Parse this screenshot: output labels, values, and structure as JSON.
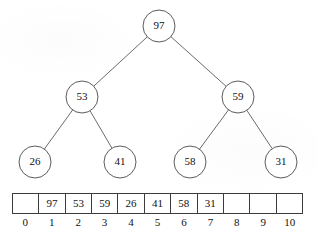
{
  "figure": {
    "stroke_color": "#4a4a4a",
    "edge_color": "#5a5a5a",
    "node_fill": "#ffffff",
    "text_color": "#111111"
  },
  "tree": {
    "node_radius": 16,
    "nodes": [
      {
        "id": "root",
        "label": "97",
        "cx": 159,
        "cy": 26,
        "level": 0
      },
      {
        "id": "n53",
        "label": "53",
        "cx": 82,
        "cy": 97,
        "level": 1
      },
      {
        "id": "n59",
        "label": "59",
        "cx": 238,
        "cy": 97,
        "level": 1
      },
      {
        "id": "n26",
        "label": "26",
        "cx": 35,
        "cy": 162,
        "level": 2
      },
      {
        "id": "n41",
        "label": "41",
        "cx": 120,
        "cy": 162,
        "level": 2
      },
      {
        "id": "n58",
        "label": "58",
        "cx": 190,
        "cy": 162,
        "level": 2
      },
      {
        "id": "n31",
        "label": "31",
        "cx": 281,
        "cy": 162,
        "level": 2
      }
    ],
    "edges": [
      {
        "from": "root",
        "to": "n53"
      },
      {
        "from": "root",
        "to": "n59"
      },
      {
        "from": "n53",
        "to": "n26"
      },
      {
        "from": "n53",
        "to": "n41"
      },
      {
        "from": "n59",
        "to": "n58"
      },
      {
        "from": "n59",
        "to": "n31"
      }
    ]
  },
  "array": {
    "indices": [
      "0",
      "1",
      "2",
      "3",
      "4",
      "5",
      "6",
      "7",
      "8",
      "9",
      "10"
    ],
    "cells": [
      "",
      "97",
      "53",
      "59",
      "26",
      "41",
      "58",
      "31",
      "",
      "",
      ""
    ]
  }
}
